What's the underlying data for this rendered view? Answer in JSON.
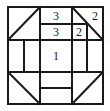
{
  "figure": {
    "colors": {
      "stroke": "#1a1a1a",
      "background": "#ffffff",
      "label": "#1a1a1a"
    },
    "canvas": {
      "width": 110,
      "height": 111
    },
    "outer_square": {
      "x": 8,
      "y": 7,
      "width": 95,
      "height": 97,
      "stroke_width": 2
    },
    "grid": {
      "vertical_x": [
        8,
        24,
        40,
        56,
        72,
        87,
        103
      ],
      "horizontal_y": [
        7,
        24,
        40,
        72,
        88,
        104
      ]
    },
    "segments": [
      {
        "name": "outer-top",
        "x1": 8,
        "y1": 7,
        "x2": 103,
        "y2": 7,
        "w": 2
      },
      {
        "name": "outer-right",
        "x1": 103,
        "y1": 7,
        "x2": 103,
        "y2": 104,
        "w": 2
      },
      {
        "name": "outer-bottom",
        "x1": 8,
        "y1": 104,
        "x2": 103,
        "y2": 104,
        "w": 2
      },
      {
        "name": "outer-left",
        "x1": 8,
        "y1": 7,
        "x2": 8,
        "y2": 104,
        "w": 2
      },
      {
        "name": "band-upper-divider",
        "x1": 8,
        "y1": 40,
        "x2": 103,
        "y2": 40,
        "w": 2
      },
      {
        "name": "band-lower-divider",
        "x1": 8,
        "y1": 72,
        "x2": 103,
        "y2": 72,
        "w": 2
      },
      {
        "name": "top-inner-row-line",
        "x1": 40,
        "y1": 24,
        "x2": 87,
        "y2": 24,
        "w": 1.6
      },
      {
        "name": "bottom-inner-row-line",
        "x1": 40,
        "y1": 88,
        "x2": 72,
        "y2": 88,
        "w": 1.6
      },
      {
        "name": "top-vert-left",
        "x1": 40,
        "y1": 7,
        "x2": 40,
        "y2": 40,
        "w": 2
      },
      {
        "name": "top-vert-mid",
        "x1": 72,
        "y1": 7,
        "x2": 72,
        "y2": 40,
        "w": 2
      },
      {
        "name": "top-vert-right",
        "x1": 87,
        "y1": 24,
        "x2": 87,
        "y2": 40,
        "w": 1.6
      },
      {
        "name": "mid-vert-1",
        "x1": 24,
        "y1": 40,
        "x2": 24,
        "y2": 72,
        "w": 1.6
      },
      {
        "name": "mid-vert-2",
        "x1": 40,
        "y1": 40,
        "x2": 40,
        "y2": 72,
        "w": 2
      },
      {
        "name": "mid-vert-3",
        "x1": 72,
        "y1": 40,
        "x2": 72,
        "y2": 72,
        "w": 2
      },
      {
        "name": "mid-vert-4",
        "x1": 87,
        "y1": 40,
        "x2": 87,
        "y2": 72,
        "w": 1.6
      },
      {
        "name": "bottom-vert-left",
        "x1": 40,
        "y1": 72,
        "x2": 40,
        "y2": 104,
        "w": 2
      },
      {
        "name": "bottom-vert-right",
        "x1": 72,
        "y1": 72,
        "x2": 72,
        "y2": 104,
        "w": 2
      },
      {
        "name": "diag-top-left",
        "x1": 8,
        "y1": 40,
        "x2": 40,
        "y2": 7,
        "w": 2
      },
      {
        "name": "diag-top-right",
        "x1": 72,
        "y1": 7,
        "x2": 103,
        "y2": 40,
        "w": 2
      },
      {
        "name": "diag-bottom-left",
        "x1": 8,
        "y1": 72,
        "x2": 40,
        "y2": 104,
        "w": 2
      },
      {
        "name": "diag-bottom-right",
        "x1": 72,
        "y1": 104,
        "x2": 103,
        "y2": 72,
        "w": 2
      }
    ],
    "labels": [
      {
        "name": "label-top-center",
        "text": "3",
        "x": 56,
        "y": 16
      },
      {
        "name": "label-top-right",
        "text": "2",
        "x": 95,
        "y": 16
      },
      {
        "name": "label-second-row-center",
        "text": "3",
        "x": 56,
        "y": 32
      },
      {
        "name": "label-second-row-right",
        "text": "2",
        "x": 79,
        "y": 32
      },
      {
        "name": "label-center",
        "text": "1",
        "x": 56,
        "y": 56
      }
    ]
  }
}
